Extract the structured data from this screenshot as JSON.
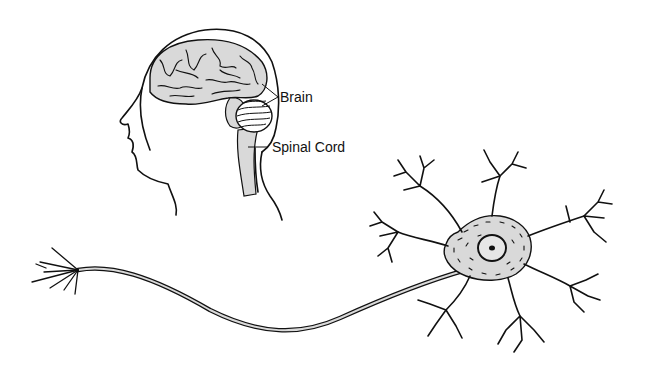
{
  "figure": {
    "type": "anatomical-illustration",
    "subjects": [
      "human-head-profile",
      "neuron"
    ]
  },
  "labels": {
    "brain": "Brain",
    "spinal_cord": "Spinal Cord"
  },
  "colors": {
    "ink": "#111111",
    "fill_gray": "#d9d9d9",
    "background": "#ffffff"
  }
}
